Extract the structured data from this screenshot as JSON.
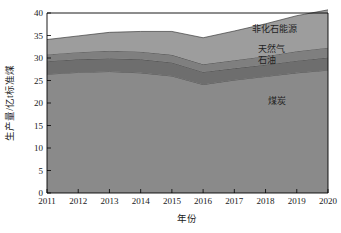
{
  "chart_data": {
    "type": "area",
    "title": "",
    "xlabel": "年份",
    "ylabel": "生产量/亿t标准煤",
    "x": [
      2011,
      2012,
      2013,
      2014,
      2015,
      2016,
      2017,
      2018,
      2019,
      2020
    ],
    "categories": [
      "2011",
      "2012",
      "2013",
      "2014",
      "2015",
      "2016",
      "2017",
      "2018",
      "2019",
      "2020"
    ],
    "xlim": [
      2011,
      2020
    ],
    "ylim": [
      0,
      40
    ],
    "yticks": [
      0,
      5,
      10,
      15,
      20,
      25,
      30,
      35,
      40
    ],
    "ytick_labels": [
      "0",
      "5",
      "10",
      "15",
      "20",
      "25",
      "30",
      "35",
      "40"
    ],
    "grid": false,
    "legend_position": "inline-right",
    "stacked": true,
    "series": [
      {
        "name": "煤炭",
        "color": "#8a8a8a",
        "values": [
          26.4,
          26.8,
          27.0,
          26.7,
          26.0,
          24.1,
          25.1,
          25.9,
          26.7,
          27.3
        ]
      },
      {
        "name": "石油",
        "color": "#6e6e6e",
        "values": [
          2.9,
          2.9,
          2.9,
          3.0,
          3.0,
          2.8,
          2.6,
          2.6,
          2.7,
          2.8
        ]
      },
      {
        "name": "天然气",
        "color": "#7f7f7f",
        "values": [
          1.5,
          1.6,
          1.7,
          1.7,
          1.7,
          1.7,
          1.8,
          1.9,
          2.1,
          2.2
        ]
      },
      {
        "name": "非化石能源",
        "color": "#9d9d9d",
        "values": [
          3.3,
          3.6,
          4.1,
          4.5,
          5.2,
          5.9,
          6.5,
          7.2,
          7.9,
          8.4
        ]
      }
    ],
    "cumulative_tops": {
      "煤炭": [
        26.4,
        26.8,
        27.0,
        26.7,
        26.0,
        24.1,
        25.1,
        25.9,
        26.7,
        27.3
      ],
      "石油": [
        29.3,
        29.7,
        29.9,
        29.7,
        29.0,
        26.9,
        27.7,
        28.5,
        29.4,
        30.1
      ],
      "天然气": [
        30.8,
        31.3,
        31.6,
        31.4,
        30.7,
        28.6,
        29.5,
        30.4,
        31.5,
        32.3
      ],
      "非化石能源": [
        34.1,
        34.9,
        35.7,
        35.9,
        35.9,
        34.5,
        36.0,
        37.6,
        39.4,
        40.7
      ]
    },
    "annotations": [
      {
        "text": "非化石能源",
        "x_px": 252,
        "y_px": 32
      },
      {
        "text": "天然气",
        "x_px": 258,
        "y_px": 52
      },
      {
        "text": "石油",
        "x_px": 258,
        "y_px": 63
      },
      {
        "text": "煤炭",
        "x_px": 268,
        "y_px": 104
      }
    ]
  },
  "colors": {
    "coal": "#8a8a8a",
    "oil": "#6e6e6e",
    "gas": "#7f7f7f",
    "nonfossil": "#9d9d9d",
    "axis": "#000000",
    "text": "#1a1a1a",
    "background": "#ffffff"
  }
}
